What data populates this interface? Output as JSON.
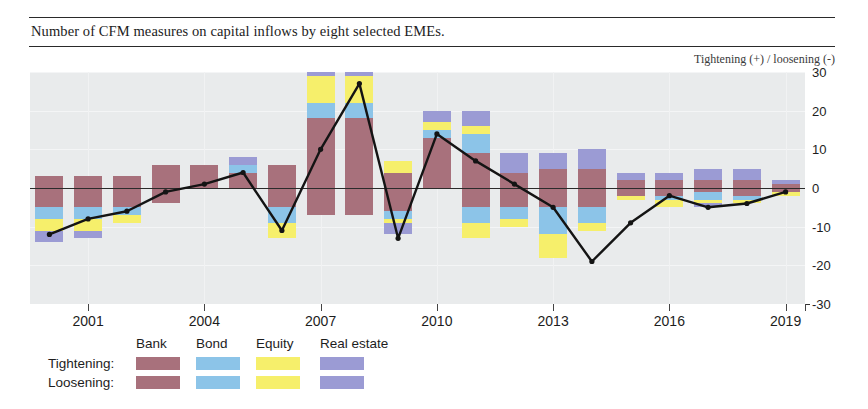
{
  "header": {
    "title": "Number of CFM measures on capital inflows by eight selected EMEs.",
    "axis_note": "Tightening (+) / loosening (-)"
  },
  "legend": {
    "column_headers": [
      "Bank",
      "Bond",
      "Equity",
      "Real estate"
    ],
    "row_labels": [
      "Tightening:",
      "Loosening:"
    ],
    "line_label": "Total net inflow tightening actions",
    "colors": {
      "bank": "#a8717c",
      "bond": "#8cc4e8",
      "equity": "#f6ef6b",
      "real_estate": "#9b9bd4",
      "line": "#141414"
    }
  },
  "chart_data": {
    "type": "bar",
    "title": "Number of CFM measures on capital inflows by eight selected EMEs.",
    "subtitle": "Tightening (+) / loosening (-)",
    "xlabel": "",
    "ylabel": "",
    "ylim": [
      -30,
      30
    ],
    "yticks": [
      30,
      20,
      10,
      0,
      -10,
      -20,
      -30
    ],
    "ytick_labels": [
      "30",
      "20",
      "10",
      "0",
      "-10",
      "-20",
      "-30"
    ],
    "grid": true,
    "legend_position": "below",
    "stacked": true,
    "x": [
      2000,
      2001,
      2002,
      2003,
      2004,
      2005,
      2006,
      2007,
      2008,
      2009,
      2010,
      2011,
      2012,
      2013,
      2014,
      2015,
      2016,
      2017,
      2018,
      2019
    ],
    "xtick_values": [
      2001,
      2004,
      2007,
      2010,
      2013,
      2016,
      2019
    ],
    "xtick_labels": [
      "2001",
      "2004",
      "2007",
      "2010",
      "2013",
      "2016",
      "2019"
    ],
    "series": [
      {
        "name": "Bank tightening",
        "key": "bank_t",
        "color": "#a8717c",
        "hatched": false,
        "values": [
          3,
          3,
          3,
          6,
          6,
          4,
          6,
          18,
          18,
          4,
          13,
          9,
          4,
          5,
          5,
          2,
          2,
          2,
          2,
          1
        ]
      },
      {
        "name": "Bond tightening",
        "key": "bond_t",
        "color": "#8cc4e8",
        "hatched": false,
        "values": [
          0,
          0,
          0,
          0,
          0,
          2,
          0,
          4,
          4,
          0,
          2,
          5,
          0,
          0,
          0,
          0,
          0,
          0,
          0,
          0
        ]
      },
      {
        "name": "Equity tightening",
        "key": "eq_t",
        "color": "#f6ef6b",
        "hatched": false,
        "values": [
          0,
          0,
          0,
          0,
          0,
          0,
          0,
          7,
          7,
          3,
          2,
          2,
          0,
          0,
          0,
          0,
          0,
          0,
          0,
          0
        ]
      },
      {
        "name": "Real estate tightening",
        "key": "re_t",
        "color": "#9b9bd4",
        "hatched": false,
        "values": [
          0,
          0,
          0,
          0,
          0,
          2,
          0,
          6,
          6,
          0,
          3,
          4,
          5,
          4,
          5,
          2,
          2,
          3,
          3,
          1
        ]
      },
      {
        "name": "Bank loosening",
        "key": "bank_l",
        "color": "#a8717c",
        "hatched": true,
        "values": [
          -5,
          -5,
          -5,
          -4,
          0,
          0,
          -5,
          -7,
          -7,
          -6,
          0,
          -5,
          -5,
          -5,
          -5,
          -2,
          -2,
          -1,
          -2,
          -1
        ]
      },
      {
        "name": "Bond loosening",
        "key": "bond_l",
        "color": "#8cc4e8",
        "hatched": true,
        "values": [
          -3,
          -3,
          -2,
          0,
          0,
          0,
          -4,
          0,
          0,
          -2,
          0,
          -4,
          -3,
          -7,
          -4,
          0,
          -1,
          -2,
          -1,
          0
        ]
      },
      {
        "name": "Equity loosening",
        "key": "eq_l",
        "color": "#f6ef6b",
        "hatched": true,
        "values": [
          -3,
          -3,
          -2,
          0,
          0,
          0,
          -4,
          0,
          0,
          -1,
          0,
          -4,
          -2,
          -6,
          -2,
          -1,
          -2,
          -1,
          -1,
          -1
        ]
      },
      {
        "name": "Real estate loosening",
        "key": "re_l",
        "color": "#9b9bd4",
        "hatched": true,
        "values": [
          -3,
          -2,
          0,
          0,
          0,
          0,
          0,
          0,
          0,
          -3,
          0,
          0,
          0,
          0,
          0,
          0,
          0,
          -1,
          0,
          0
        ]
      }
    ],
    "line_series": {
      "name": "Total net inflow tightening actions",
      "color": "#141414",
      "marker": "circle",
      "values": [
        -12,
        -8,
        -6,
        -1,
        1,
        4,
        -11,
        10,
        27,
        -13,
        14,
        7,
        1,
        -5,
        -19,
        -9,
        -2,
        -5,
        -4,
        -1
      ]
    }
  }
}
